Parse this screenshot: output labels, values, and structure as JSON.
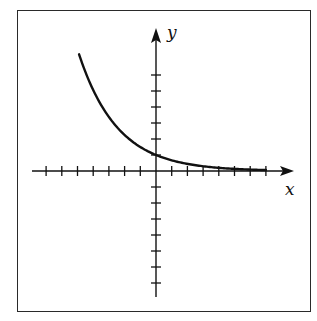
{
  "chart_data": {
    "type": "line",
    "title": "",
    "xlabel": "x",
    "ylabel": "y",
    "function": "y = (2/3)^x",
    "xlim": [
      -7.8,
      8.7
    ],
    "ylim": [
      -7.9,
      8.9
    ],
    "x_ticks": [
      -7,
      -6,
      -5,
      -4,
      -3,
      -2,
      -1,
      1,
      2,
      3,
      4,
      5,
      6,
      7
    ],
    "y_ticks": [
      -7,
      -6,
      -5,
      -4,
      -3,
      -2,
      -1,
      1,
      2,
      3,
      4,
      5,
      6
    ],
    "tick_labels_shown": false,
    "grid": false,
    "legend": null,
    "series": [
      {
        "name": "exponential decay",
        "x": [
          -4.9,
          -4,
          -3,
          -2,
          -1,
          0,
          1,
          2,
          3,
          4,
          5,
          6,
          7
        ],
        "y": [
          7.3,
          5.06,
          3.38,
          2.25,
          1.5,
          1.0,
          0.67,
          0.44,
          0.3,
          0.2,
          0.13,
          0.09,
          0.06
        ]
      }
    ]
  },
  "labels": {
    "x_axis": "x",
    "y_axis": "y"
  },
  "colors": {
    "ink": "#111111",
    "background": "#ffffff"
  }
}
